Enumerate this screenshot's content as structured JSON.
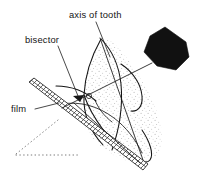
{
  "figure": {
    "title": "axis of tooth",
    "background_color": "#ffffff",
    "ink_color": "#151515",
    "stipple_color": "#b4b4b4",
    "labels": [
      {
        "id": "axis-of-tooth",
        "text": "axis of tooth",
        "x": 69,
        "y": 18,
        "anchor": "start"
      },
      {
        "id": "bisector",
        "text": "bisector",
        "x": 25,
        "y": 43,
        "anchor": "start"
      },
      {
        "id": "film",
        "text": "film",
        "x": 11,
        "y": 112,
        "anchor": "start"
      }
    ],
    "leaders": [
      {
        "id": "axis-of-tooth-leader",
        "from_label": "axis of tooth",
        "path": "M 96 22 L 110 57"
      },
      {
        "id": "bisector-leader",
        "from_label": "bisector",
        "path": "M 58 46 L 80 101"
      },
      {
        "id": "film-leader",
        "from_label": "film",
        "path": "M 35 109 L 59 103"
      }
    ],
    "elements": [
      {
        "id": "x-ray-source-cone",
        "kind": "solid-polygon",
        "color": "#111111",
        "points": "165,27 186,42 189,57 176,70 157,66 144,52 150,36"
      },
      {
        "id": "film-strip",
        "kind": "hatched-band",
        "from": [
          30,
          85
        ],
        "to": [
          144,
          167
        ],
        "hatch_count": 44
      },
      {
        "id": "tooth-outline",
        "kind": "curve"
      },
      {
        "id": "central-ray",
        "kind": "line",
        "path": "M 152 63 L 62 108"
      },
      {
        "id": "axis-line",
        "kind": "line",
        "path": "M 100 38 L 143 160"
      },
      {
        "id": "bisector-line",
        "kind": "line",
        "path": "M 74 103 L 140 163"
      },
      {
        "id": "bisector-arrowhead",
        "kind": "arrowhead",
        "at": [
          80,
          102
        ]
      },
      {
        "id": "right-angle-mark",
        "kind": "circle-mark",
        "at": [
          89,
          96
        ],
        "r": 2.6
      },
      {
        "id": "construction-dotted-diagonal",
        "kind": "dotted",
        "path": "M 58 120 L 16 154"
      },
      {
        "id": "construction-dotted-horizontal",
        "kind": "dotted",
        "path": "M 16 155 L 78 155"
      }
    ]
  }
}
